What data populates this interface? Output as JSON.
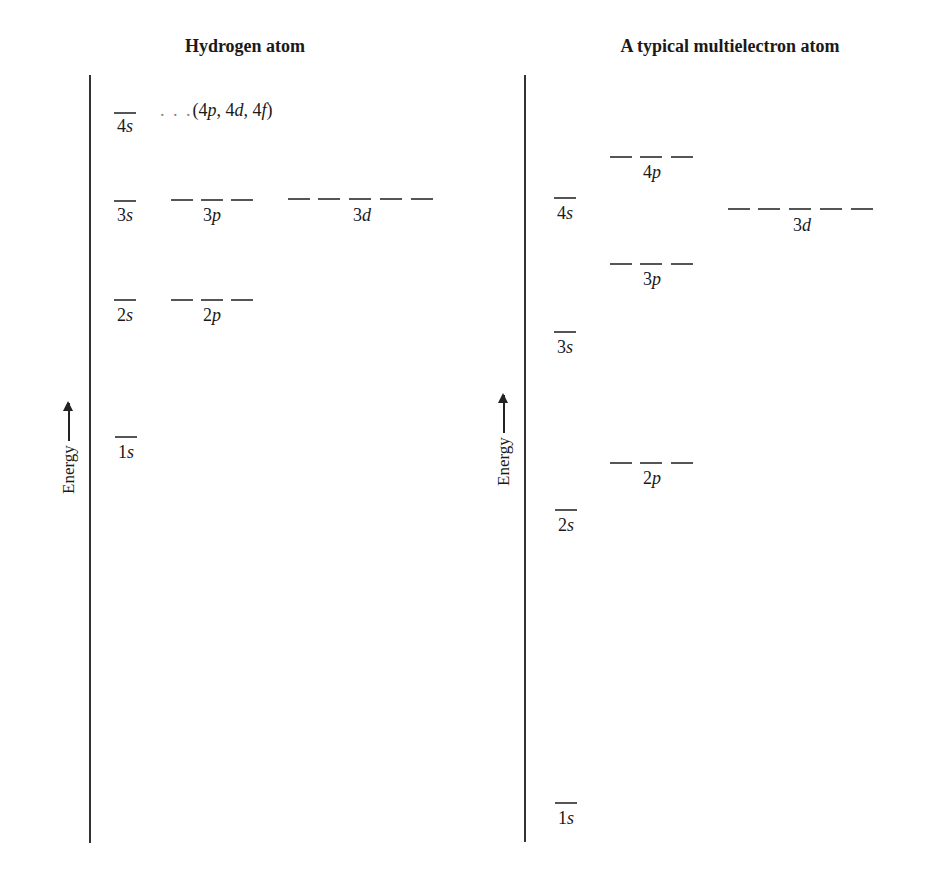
{
  "panels": [
    {
      "title": "Hydrogen atom",
      "axis_label": "Energy",
      "levels": [
        {
          "name": "1s",
          "n": "1",
          "l": "s",
          "count": 1
        },
        {
          "name": "2s",
          "n": "2",
          "l": "s",
          "count": 1
        },
        {
          "name": "2p",
          "n": "2",
          "l": "p",
          "count": 3
        },
        {
          "name": "3s",
          "n": "3",
          "l": "s",
          "count": 1
        },
        {
          "name": "3p",
          "n": "3",
          "l": "p",
          "count": 3
        },
        {
          "name": "3d",
          "n": "3",
          "l": "d",
          "count": 5
        },
        {
          "name": "4s",
          "n": "4",
          "l": "s",
          "count": 1
        }
      ],
      "note": {
        "dots": ". . .",
        "text": "(4p, 4d, 4f)",
        "parts": [
          "(",
          "4",
          "p",
          ", ",
          "4",
          "d",
          ", ",
          "4",
          "f",
          ")"
        ]
      }
    },
    {
      "title": "A typical multielectron atom",
      "axis_label": "Energy",
      "levels": [
        {
          "name": "1s",
          "n": "1",
          "l": "s",
          "count": 1
        },
        {
          "name": "2s",
          "n": "2",
          "l": "s",
          "count": 1
        },
        {
          "name": "2p",
          "n": "2",
          "l": "p",
          "count": 3
        },
        {
          "name": "3s",
          "n": "3",
          "l": "s",
          "count": 1
        },
        {
          "name": "3p",
          "n": "3",
          "l": "p",
          "count": 3
        },
        {
          "name": "4s",
          "n": "4",
          "l": "s",
          "count": 1
        },
        {
          "name": "3d",
          "n": "3",
          "l": "d",
          "count": 5
        },
        {
          "name": "4p",
          "n": "4",
          "l": "p",
          "count": 3
        }
      ]
    }
  ],
  "colors": {
    "level_line": "#555555",
    "axis": "#333333",
    "text": "#1a1a1a"
  }
}
